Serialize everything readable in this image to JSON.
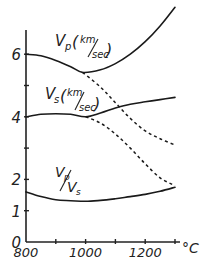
{
  "chart_data": {
    "type": "line",
    "title": "",
    "xlabel": "°C",
    "ylabel": "",
    "xlim": [
      800,
      1320
    ],
    "ylim": [
      0,
      7.6
    ],
    "grid": false,
    "x_ticks": [
      800,
      900,
      1000,
      1100,
      1200,
      1300
    ],
    "x_tick_labels": [
      "800",
      "1000",
      "1200"
    ],
    "x_tick_labeled_values": [
      800,
      1000,
      1200
    ],
    "y_ticks": [
      0,
      1,
      2,
      3,
      4,
      5,
      6
    ],
    "y_tick_labels": [
      "0",
      "1",
      "2",
      "4",
      "6"
    ],
    "y_tick_labeled_values": [
      0,
      1,
      2,
      4,
      6
    ],
    "x_unit_label": "°C",
    "series": [
      {
        "name": "Vp (km/sec)",
        "label_main": "V",
        "label_sub": "p",
        "label_unit": "(km/sec)",
        "style": "solid",
        "x": [
          800,
          850,
          900,
          950,
          990,
          1050,
          1100,
          1150,
          1200,
          1250,
          1300
        ],
        "y": [
          6.0,
          5.95,
          5.8,
          5.6,
          5.42,
          5.5,
          5.7,
          6.0,
          6.4,
          6.9,
          7.5
        ]
      },
      {
        "name": "Vp extrapolated",
        "style": "dashed",
        "x": [
          990,
          1050,
          1100,
          1150,
          1200,
          1250,
          1300
        ],
        "y": [
          5.42,
          4.95,
          4.45,
          3.95,
          3.55,
          3.3,
          3.1
        ]
      },
      {
        "name": "Vs (km/sec)",
        "label_main": "V",
        "label_sub": "s",
        "label_unit": "(km/sec)",
        "style": "solid",
        "x": [
          800,
          850,
          900,
          950,
          1000,
          1050,
          1100,
          1150,
          1200,
          1250,
          1300
        ],
        "y": [
          4.0,
          4.08,
          4.1,
          4.08,
          4.0,
          4.12,
          4.28,
          4.4,
          4.48,
          4.55,
          4.62
        ]
      },
      {
        "name": "Vs extrapolated",
        "style": "dashed",
        "x": [
          1000,
          1050,
          1100,
          1150,
          1200,
          1250,
          1300
        ],
        "y": [
          4.0,
          3.8,
          3.45,
          3.0,
          2.5,
          2.05,
          1.8
        ]
      },
      {
        "name": "Vp/Vs",
        "label_main": "Vp/Vs",
        "style": "solid",
        "x": [
          800,
          850,
          900,
          950,
          1000,
          1050,
          1100,
          1150,
          1200,
          1250,
          1300
        ],
        "y": [
          1.6,
          1.45,
          1.35,
          1.32,
          1.3,
          1.33,
          1.38,
          1.45,
          1.52,
          1.62,
          1.75
        ]
      }
    ]
  }
}
